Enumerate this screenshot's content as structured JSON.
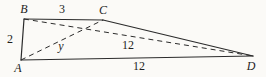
{
  "figure": {
    "type": "geometry-diagram",
    "colors": {
      "line": "#2b2b2b",
      "text": "#1e1e1e",
      "background": "#fbfaf7"
    },
    "labels": {
      "vertex_A": "A",
      "vertex_B": "B",
      "vertex_C": "C",
      "vertex_D": "D",
      "side_AB": "2",
      "side_BC": "3",
      "side_AD": "12",
      "diagonal_BD": "12",
      "diagonal_AC": "y"
    },
    "solid_sides": [
      "AB",
      "BC",
      "CD",
      "AD"
    ],
    "dashed_diagonals": [
      "AC",
      "BD"
    ]
  }
}
